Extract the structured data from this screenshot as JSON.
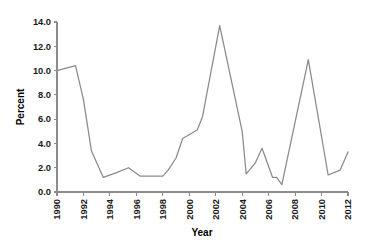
{
  "chart_data": {
    "type": "line",
    "title": "",
    "xlabel": "Year",
    "ylabel": "Percent",
    "xlim": [
      1990,
      2012
    ],
    "ylim": [
      0.0,
      14.0
    ],
    "grid": false,
    "legend": null,
    "line_color": "#8a8a8a",
    "axis_color": "#8c8c8c",
    "text_color": "#1a1a1a",
    "xticks": [
      1990,
      1992,
      1994,
      1996,
      1998,
      2000,
      2002,
      2004,
      2006,
      2008,
      2010,
      2012
    ],
    "xtick_labels": [
      "1990",
      "1992",
      "1994",
      "1996",
      "1998",
      "2000",
      "2002",
      "2004",
      "2006",
      "2008",
      "2010",
      "2012"
    ],
    "xtick_rotation": 90,
    "yticks": [
      0.0,
      2.0,
      4.0,
      6.0,
      8.0,
      10.0,
      12.0,
      14.0
    ],
    "ytick_labels": [
      "0.0",
      "2.0",
      "4.0",
      "6.0",
      "8.0",
      "10.0",
      "12.0",
      "14.0"
    ],
    "series": [
      {
        "name": "Percent",
        "x": [
          1990.0,
          1991.4,
          1992.0,
          1992.6,
          1993.5,
          1994.5,
          1995.4,
          1996.3,
          1996.9,
          1998.0,
          1998.4,
          1999.0,
          1999.5,
          2000.6,
          2001.0,
          2002.3,
          2004.0,
          2004.3,
          2005.0,
          2005.5,
          2006.3,
          2006.6,
          2007.0,
          2009.0,
          2010.5,
          2011.4,
          2012.0
        ],
        "y": [
          10.0,
          10.4,
          7.6,
          3.4,
          1.2,
          1.6,
          2.0,
          1.3,
          1.3,
          1.3,
          1.8,
          2.8,
          4.4,
          5.1,
          6.2,
          13.7,
          5.0,
          1.5,
          2.4,
          3.6,
          1.2,
          1.2,
          0.6,
          10.9,
          1.4,
          1.8,
          3.3
        ]
      }
    ]
  },
  "geometry": {
    "plot_left": 57,
    "plot_right": 348,
    "plot_top": 22,
    "plot_bottom": 192
  }
}
